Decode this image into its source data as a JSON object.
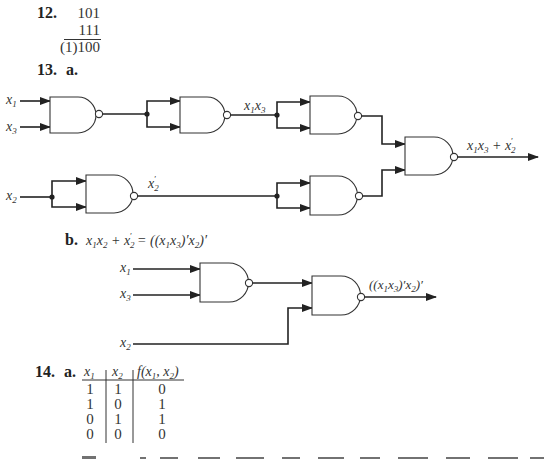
{
  "problem12": {
    "number": "12.",
    "addend1": "101",
    "addend2": "111",
    "sum": "(1)100"
  },
  "problem13": {
    "number": "13.",
    "part_a": {
      "label": "a.",
      "inputs": [
        "x1",
        "x3",
        "x2"
      ],
      "intermediate_labels": {
        "x1x3": "x₁x₃",
        "x2_prime": "x′₂"
      },
      "output_label": "x₁x₃ + x′₂",
      "gate_type": "NAND",
      "gate_count": 5
    },
    "part_b": {
      "label": "b.",
      "equation": "x₁x₂ + x′₂ = ((x₁x₃)′x₂)′",
      "inputs": [
        "x1",
        "x3",
        "x2"
      ],
      "output_label": "((x₁x₃)′x₂)′",
      "gate_type": "NAND",
      "gate_count": 2
    }
  },
  "problem14": {
    "number": "14.",
    "part_a": {
      "label": "a.",
      "table": {
        "headers": [
          "x₁",
          "x₂",
          "f(x₁, x₂)"
        ],
        "rows": [
          [
            "1",
            "1",
            "0"
          ],
          [
            "1",
            "0",
            "1"
          ],
          [
            "0",
            "1",
            "1"
          ],
          [
            "0",
            "0",
            "0"
          ]
        ]
      }
    },
    "clipped_footer": "H...e ... 0 ... the ... ((\"fff\")) ... 0 ..."
  }
}
